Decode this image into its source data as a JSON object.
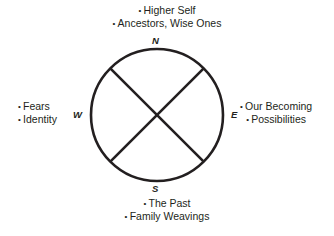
{
  "diagram": {
    "title": "",
    "directions": {
      "north": {
        "letter": "N",
        "items": [
          "Higher Self",
          "Ancestors, Wise Ones"
        ]
      },
      "east": {
        "letter": "E",
        "items": [
          "Our Becoming",
          "Possibilities"
        ]
      },
      "south": {
        "letter": "S",
        "items": [
          "The Past",
          "Family Weavings"
        ]
      },
      "west": {
        "letter": "W",
        "items": [
          "Fears",
          "Identity"
        ]
      }
    },
    "circle": {
      "cx": 157,
      "cy": 115,
      "r": 66,
      "stroke": "#231f20"
    }
  }
}
